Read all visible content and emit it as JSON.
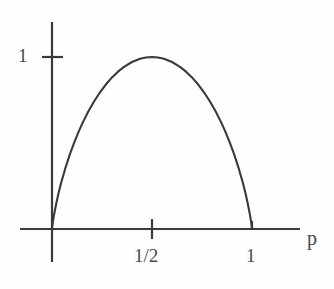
{
  "figure": {
    "name": "binary-entropy-function-plot",
    "background_color": "#fefefe",
    "line_color": "#3a3a3a",
    "axis_color": "#3b3b3b"
  },
  "labels": {
    "y_tick_one": "1",
    "x_tick_half": "1/2",
    "x_tick_one": "1",
    "x_axis_name": "p"
  },
  "chart_data": {
    "type": "line",
    "title": "",
    "subtitle": "",
    "xlabel": "p",
    "ylabel": "",
    "xlim": [
      -0.13,
      1.2
    ],
    "ylim": [
      -0.17,
      1.22
    ],
    "grid": false,
    "legend": null,
    "annotations": [],
    "xticks": [
      0.5,
      1
    ],
    "xticklabels": [
      "1/2",
      "1"
    ],
    "yticks": [
      1
    ],
    "yticklabels": [
      "1"
    ],
    "series": [
      {
        "name": "H(p) = -p log2 p - (1-p) log2 (1-p)",
        "x": [
          0.0,
          0.002,
          0.005,
          0.01,
          0.02,
          0.03,
          0.04,
          0.05,
          0.07,
          0.09,
          0.11,
          0.13,
          0.15,
          0.18,
          0.21,
          0.24,
          0.27,
          0.3,
          0.33,
          0.36,
          0.4,
          0.44,
          0.47,
          0.5,
          0.53,
          0.56,
          0.6,
          0.64,
          0.67,
          0.7,
          0.73,
          0.76,
          0.79,
          0.82,
          0.85,
          0.87,
          0.89,
          0.91,
          0.93,
          0.95,
          0.96,
          0.97,
          0.98,
          0.99,
          0.995,
          0.998,
          1.0
        ],
        "y": [
          0.0,
          0.0219,
          0.0454,
          0.0808,
          0.1414,
          0.1944,
          0.2423,
          0.2864,
          0.3659,
          0.4365,
          0.4999,
          0.5574,
          0.6098,
          0.6801,
          0.7415,
          0.795,
          0.8415,
          0.8813,
          0.9149,
          0.9427,
          0.971,
          0.9896,
          0.9974,
          1.0,
          0.9974,
          0.9896,
          0.971,
          0.9427,
          0.9149,
          0.8813,
          0.8415,
          0.795,
          0.7415,
          0.6801,
          0.6098,
          0.5574,
          0.4999,
          0.4365,
          0.3659,
          0.2864,
          0.2423,
          0.1944,
          0.1414,
          0.0808,
          0.0454,
          0.0219,
          0.0
        ]
      }
    ]
  }
}
